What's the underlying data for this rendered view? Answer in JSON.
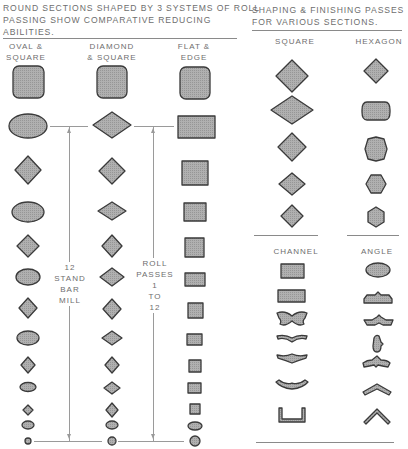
{
  "left_panel": {
    "caption_lines": [
      "ROUND SECTIONS SHAPED BY 3 SYSTEMS OF ROLL",
      "PASSING SHOW COMPARATIVE REDUCING",
      "ABILITIES."
    ],
    "columns": [
      {
        "header": "OVAL &\nSQUARE",
        "passes": [
          "square-stock",
          "oval",
          "diamond",
          "oval",
          "diamond",
          "oval",
          "diamond",
          "oval",
          "diamond",
          "oval",
          "diamond",
          "oval",
          "round"
        ]
      },
      {
        "header": "DIAMOND\n& SQUARE",
        "passes": [
          "square-stock",
          "diamond-flat",
          "diamond",
          "diamond-flat",
          "diamond",
          "diamond-flat",
          "diamond",
          "diamond-flat",
          "diamond",
          "diamond-flat",
          "diamond",
          "oval",
          "round"
        ]
      },
      {
        "header": "FLAT &\nEDGE",
        "passes": [
          "square-stock",
          "flat",
          "square",
          "square",
          "square",
          "flat",
          "square",
          "square",
          "square",
          "square",
          "square",
          "oval",
          "round"
        ]
      }
    ],
    "annotation_mill": "12\nSTAND\nBAR\nMILL",
    "annotation_passes": "ROLL\nPASSES\n1\nTO\n12"
  },
  "right_panel": {
    "caption_lines": [
      "SHAPING & FINISHING PASSES",
      "FOR VARIOUS SECTIONS."
    ],
    "top_columns": [
      {
        "header": "SQUARE",
        "passes": [
          "diamond",
          "flat-diamond",
          "diamond",
          "diamond",
          "diamond"
        ]
      },
      {
        "header": "HEXAGON",
        "passes": [
          "diamond",
          "rounded-rect",
          "octagon",
          "hexagon",
          "hexagon"
        ]
      }
    ],
    "bottom_columns": [
      {
        "header": "CHANNEL",
        "passes": [
          "rectangle",
          "rectangle",
          "bow-tie",
          "wave",
          "wave",
          "wave",
          "channel"
        ]
      },
      {
        "header": "ANGLE",
        "passes": [
          "oval",
          "bump",
          "wing",
          "bulb",
          "wing",
          "angle-blunt",
          "angle"
        ]
      }
    ]
  },
  "colors": {
    "fill": "#a8a8a8",
    "stroke": "#3a3a3a",
    "text": "#6e6e6e",
    "rule": "#8a8a8a"
  }
}
